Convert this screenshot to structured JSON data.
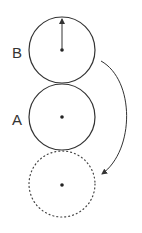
{
  "diagram": {
    "stroke_color": "#333333",
    "circles": [
      {
        "id": "B",
        "label": "B",
        "cx": 62,
        "cy": 50,
        "r": 33,
        "style": "solid"
      },
      {
        "id": "A",
        "label": "A",
        "cx": 62,
        "cy": 117,
        "r": 33,
        "style": "solid"
      },
      {
        "id": "ghost",
        "label": "",
        "cx": 62,
        "cy": 185,
        "r": 33,
        "style": "dotted"
      }
    ],
    "labels": {
      "b": "B",
      "a": "A"
    },
    "arrows": {
      "radius_arrow": "arrow from center of B upward to top of circle",
      "rotation_arrow": "curved arrow from right of B downward to dotted circle"
    }
  }
}
